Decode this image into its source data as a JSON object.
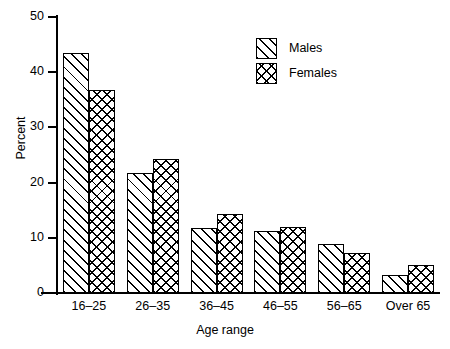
{
  "chart_data": {
    "type": "bar",
    "title": "",
    "xlabel": "Age range",
    "ylabel": "Percent",
    "categories": [
      "16–25",
      "26–35",
      "36–45",
      "46–55",
      "56–65",
      "Over 65"
    ],
    "series": [
      {
        "name": "Males",
        "values": [
          43.5,
          21.7,
          11.8,
          11.2,
          8.8,
          3.2
        ],
        "pattern": "diagonal-hatch"
      },
      {
        "name": "Females",
        "values": [
          36.7,
          24.3,
          14.3,
          12.0,
          7.3,
          5.0
        ],
        "pattern": "cross-hatch"
      }
    ],
    "ylim": [
      0,
      50
    ],
    "yticks": [
      0,
      10,
      20,
      30,
      40,
      50
    ],
    "ytick_labels": [
      "0",
      "10",
      "20",
      "30",
      "40",
      "50"
    ],
    "grid": false,
    "legend_position": "top-right",
    "colors": {
      "line": "#000000",
      "fill": "#ffffff",
      "background": "#ffffff"
    }
  },
  "axes": {
    "y_title": "Percent",
    "x_title": "Age range"
  },
  "legend": {
    "entries": [
      {
        "label": "Males"
      },
      {
        "label": "Females"
      }
    ]
  }
}
